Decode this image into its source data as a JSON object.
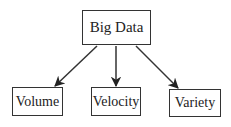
{
  "diagram": {
    "type": "tree",
    "root": {
      "id": "big-data",
      "label": "Big Data"
    },
    "children": [
      {
        "id": "volume",
        "label": "Volume"
      },
      {
        "id": "velocity",
        "label": "Velocity"
      },
      {
        "id": "variety",
        "label": "Variety"
      }
    ],
    "edges": [
      {
        "from": "big-data",
        "to": "volume"
      },
      {
        "from": "big-data",
        "to": "velocity"
      },
      {
        "from": "big-data",
        "to": "variety"
      }
    ],
    "colors": {
      "stroke": "#333333",
      "text": "#222222",
      "background": "#ffffff"
    }
  }
}
